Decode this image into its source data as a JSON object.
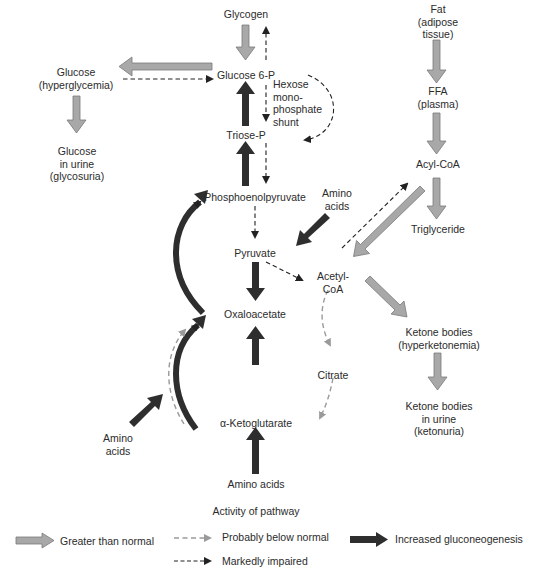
{
  "nodes": {
    "glycogen": "Glycogen",
    "glucose_hyper": "Glucose\n(hyperglycemia)",
    "glucose6p": "Glucose 6-P",
    "hms": "Hexose\nmono-\nphosphate\nshunt",
    "glucose_urine": "Glucose\nin urine\n(glycosuria)",
    "triose_p": "Triose-P",
    "pep": "Phosphoenolpyruvate",
    "amino_acids_top": "Amino\nacids",
    "pyruvate": "Pyruvate",
    "acetyl_coa": "Acetyl-\nCoA",
    "oxaloacetate": "Oxaloacetate",
    "citrate": "Citrate",
    "alpha_kg": "α-Ketoglutarate",
    "amino_acids_left": "Amino\nacids",
    "amino_acids_bottom": "Amino acids",
    "fat": "Fat\n(adipose\ntissue)",
    "ffa": "FFA\n(plasma)",
    "acyl_coa": "Acyl-CoA",
    "triglyceride": "Triglyceride",
    "ketone_hyper": "Ketone bodies\n(hyperketonemia)",
    "ketone_urine": "Ketone bodies\nin urine\n(ketonuria)"
  },
  "legend": {
    "title": "Activity of pathway",
    "greater": "Greater than normal",
    "probably_below": "Probably below normal",
    "markedly_impaired": "Markedly impaired",
    "increased_gng": "Increased gluconeogenesis"
  },
  "colors": {
    "gray_arrow": "#a8a8a8",
    "gray_outline": "#7a7a7a",
    "dark_arrow": "#2e2e2e",
    "light_dash": "#9a9a9a",
    "dark_dash": "#222222",
    "text": "#2b2b2b"
  }
}
